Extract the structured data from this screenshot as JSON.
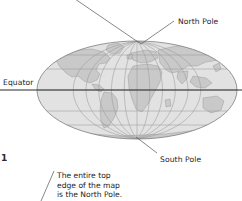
{
  "figure": {
    "number_fragment": "1",
    "map_projection": "mollweide-world-map",
    "colors": {
      "ocean": "#e2e2e2",
      "land": "#c9c9c9",
      "graticule": "#9a9a9a",
      "outline": "#7d7d7d",
      "equator_line": "#2b2b2b",
      "leader_line": "#555555",
      "text": "#1c1c1c",
      "background": "#ffffff"
    }
  },
  "labels": {
    "north_pole": "North Pole",
    "south_pole": "South Pole",
    "equator": "Equator"
  },
  "caption": {
    "line1": "The entire top",
    "line2": "edge of the map",
    "line3": "is the North Pole."
  },
  "map": {
    "ellipse": {
      "cx": 137,
      "cy": 90,
      "rx": 100,
      "ry": 49
    },
    "parallels_y": [
      69,
      90,
      111
    ],
    "equator_y": 90,
    "equator_line_extent": {
      "x1": 0,
      "x2": 242
    }
  },
  "leaders": [
    {
      "name": "north-pole-leader",
      "x1": 172,
      "y1": 22,
      "x2": 141,
      "y2": 44
    },
    {
      "name": "top-edge-leader",
      "x1": 141,
      "y1": 44,
      "x2": 75,
      "y2": 0
    },
    {
      "name": "south-pole-leader",
      "x1": 157,
      "y1": 153,
      "x2": 136,
      "y2": 137
    },
    {
      "name": "caption-leader",
      "x1": 53,
      "y1": 172,
      "x2": 42,
      "y2": 198
    }
  ]
}
